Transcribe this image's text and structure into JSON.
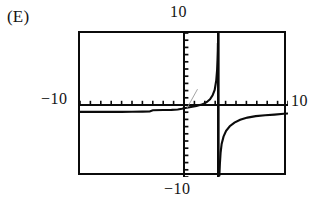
{
  "figure": {
    "choice_label": "(E)",
    "background_color": "#ffffff",
    "ink_color": "#0b0b0b"
  },
  "axis_labels": {
    "top": "10",
    "left": "−10",
    "right": "10",
    "bottom": "−10"
  },
  "chart_data": {
    "type": "line",
    "title": "",
    "subtitle": "",
    "xlabel": "",
    "ylabel": "",
    "xlim": [
      -10,
      10
    ],
    "ylim": [
      -10,
      10
    ],
    "grid": false,
    "legend": null,
    "axis_style": "graphing-calculator-window",
    "x_axis_tick_spacing": 1,
    "y_axis_tick_spacing": 1,
    "x_axis_tick_count": 20,
    "y_axis_tick_count": 20,
    "annotations": [
      {
        "name": "vertical-asymptote",
        "x": 3.3,
        "style": "solid-thick-vertical-line"
      },
      {
        "name": "y-axis",
        "x": 0,
        "style": "tick-dotted-vertical-line"
      },
      {
        "name": "x-axis",
        "y": 0,
        "style": "tick-dotted-horizontal-line"
      },
      {
        "name": "stray-thin-diagonal-artifact",
        "from": [
          0.3,
          -0.4
        ],
        "to": [
          1.3,
          2.2
        ]
      }
    ],
    "series": [
      {
        "name": "branch-left",
        "description": "Nearly horizontal branch just below the x-axis, approaching y = -1 from the left frame edge and rising toward the asymptote.",
        "points": [
          [
            -10.0,
            -0.95
          ],
          [
            -9.0,
            -0.95
          ],
          [
            -8.0,
            -0.95
          ],
          [
            -7.0,
            -0.95
          ],
          [
            -6.0,
            -0.95
          ],
          [
            -5.0,
            -0.93
          ],
          [
            -4.0,
            -0.92
          ],
          [
            -3.3,
            -0.9
          ],
          [
            -3.0,
            -0.72
          ],
          [
            -2.0,
            -0.7
          ],
          [
            -1.2,
            -0.68
          ],
          [
            -0.6,
            -0.62
          ],
          [
            -0.2,
            -0.52
          ],
          [
            0.0,
            -0.45
          ]
        ]
      },
      {
        "name": "branch-middle",
        "description": "Rises steeply from near the origin to +infinity at the vertical asymptote x = 3.3.",
        "points": [
          [
            0.0,
            -0.45
          ],
          [
            0.4,
            -0.35
          ],
          [
            0.8,
            -0.25
          ],
          [
            1.2,
            -0.12
          ],
          [
            1.6,
            0.02
          ],
          [
            1.9,
            0.18
          ],
          [
            2.2,
            0.42
          ],
          [
            2.5,
            0.8
          ],
          [
            2.75,
            1.35
          ],
          [
            2.95,
            2.1
          ],
          [
            3.1,
            3.4
          ],
          [
            3.18,
            4.8
          ],
          [
            3.22,
            6.2
          ],
          [
            3.25,
            7.6
          ],
          [
            3.26,
            8.6
          ]
        ]
      },
      {
        "name": "branch-right",
        "description": "Comes up from -infinity just right of the asymptote x = 3.3, rising and flattening toward y = -1.1 at the right frame edge.",
        "points": [
          [
            3.4,
            -9.9
          ],
          [
            3.45,
            -8.2
          ],
          [
            3.52,
            -6.6
          ],
          [
            3.62,
            -5.4
          ],
          [
            3.8,
            -4.4
          ],
          [
            4.05,
            -3.6
          ],
          [
            4.4,
            -2.95
          ],
          [
            4.85,
            -2.45
          ],
          [
            5.4,
            -2.05
          ],
          [
            6.1,
            -1.75
          ],
          [
            6.9,
            -1.55
          ],
          [
            7.8,
            -1.42
          ],
          [
            8.7,
            -1.33
          ],
          [
            9.6,
            -1.22
          ],
          [
            10.0,
            -1.18
          ]
        ]
      }
    ]
  }
}
